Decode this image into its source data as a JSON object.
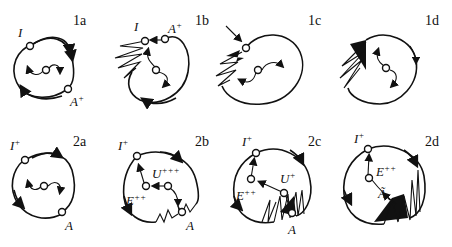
{
  "figure": {
    "panels": [
      {
        "id": "1a",
        "label": "1a",
        "states": [
          {
            "name": "I",
            "sup": ""
          },
          {
            "name": "A",
            "sup": "+"
          }
        ]
      },
      {
        "id": "1b",
        "label": "1b",
        "states": [
          {
            "name": "I",
            "sup": ""
          },
          {
            "name": "A",
            "sup": "+"
          }
        ]
      },
      {
        "id": "1c",
        "label": "1c",
        "states": []
      },
      {
        "id": "1d",
        "label": "1d",
        "states": []
      },
      {
        "id": "2a",
        "label": "2a",
        "states": [
          {
            "name": "I",
            "sup": "+"
          },
          {
            "name": "A",
            "sup": ""
          }
        ]
      },
      {
        "id": "2b",
        "label": "2b",
        "states": [
          {
            "name": "I",
            "sup": "+"
          },
          {
            "name": "U",
            "sup": "+++"
          },
          {
            "name": "E",
            "sup": "++"
          },
          {
            "name": "A",
            "sup": ""
          }
        ]
      },
      {
        "id": "2c",
        "label": "2c",
        "states": [
          {
            "name": "I",
            "sup": "+"
          },
          {
            "name": "U",
            "sup": "+"
          },
          {
            "name": "E",
            "sup": "++"
          },
          {
            "name": "A",
            "sup": ""
          }
        ]
      },
      {
        "id": "2d",
        "label": "2d",
        "states": [
          {
            "name": "I",
            "sup": "+"
          },
          {
            "name": "E",
            "sup": "++"
          },
          {
            "name": "Ã",
            "sup": ""
          }
        ]
      }
    ]
  }
}
